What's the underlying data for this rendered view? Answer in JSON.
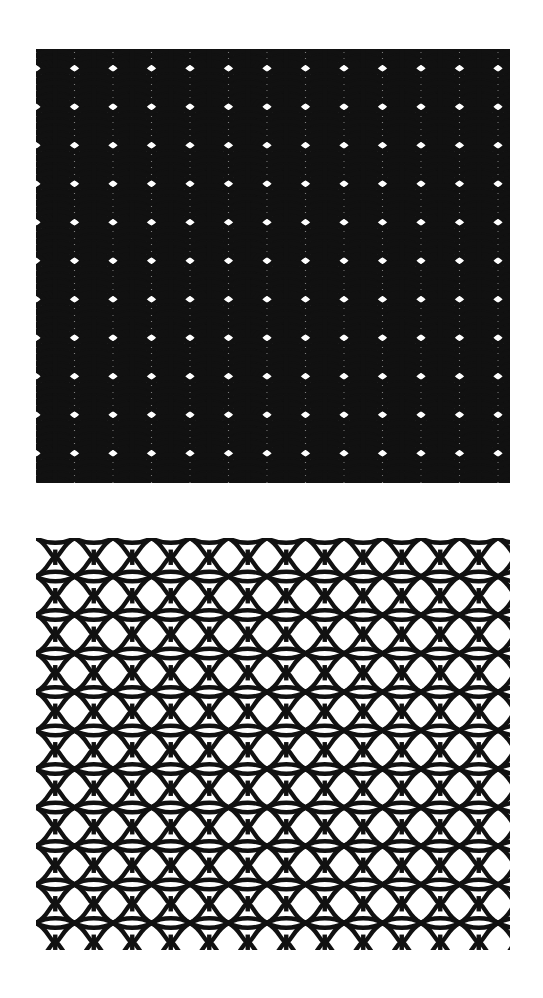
{
  "page": {
    "width": 543,
    "height": 998,
    "background_color": "#ffffff",
    "ink_color": "#111111"
  },
  "panels": [
    {
      "id": "top-panel",
      "name": "dense-arc-lattice",
      "label": "Dense interlocking arc lattice",
      "x": 36,
      "y": 49,
      "width": 474,
      "height": 434,
      "density": "dense",
      "cell_width": 38.5,
      "cell_height": 38.5,
      "stroke_width": 4.6,
      "layers_per_cell": 5,
      "layer_offsets": [
        -13,
        -6.5,
        0,
        6.5,
        13
      ],
      "ink_color": "#111111",
      "columns": 13,
      "rows": 12
    },
    {
      "id": "bottom-panel",
      "name": "open-arc-lattice",
      "label": "Open interlocking arc lattice",
      "x": 36,
      "y": 538,
      "width": 474,
      "height": 412,
      "density": "open",
      "cell_width": 38.5,
      "cell_height": 38.5,
      "stroke_width": 4.4,
      "layers_per_cell": 1,
      "layer_offsets": [
        0
      ],
      "ink_color": "#111111",
      "columns": 13,
      "rows": 11
    }
  ],
  "motif": {
    "name": "four-arc-bowtie",
    "description": "Unit cell formed from four concave arcs meeting at the cell centre, producing a bowtie/X with lens-shaped voids between rows.",
    "arc_sweep_ratio": 0.62,
    "waist_ratio": 0.22
  }
}
